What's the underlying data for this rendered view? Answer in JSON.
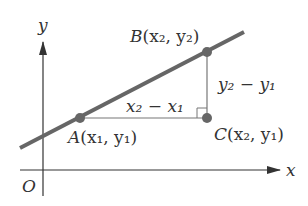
{
  "diagram": {
    "type": "coordinate-geometry",
    "colors": {
      "axis": "#333333",
      "line": "#666666",
      "point": "#666666",
      "guide": "#777777",
      "text": "#333333"
    },
    "axes": {
      "x_label": "x",
      "y_label": "y",
      "origin_label": "O"
    },
    "points": {
      "A": {
        "name": "A",
        "coords": "(x₁, y₁)"
      },
      "B": {
        "name": "B",
        "coords": "(x₂, y₂)"
      },
      "C": {
        "name": "C",
        "coords": "(x₂, y₁)"
      }
    },
    "segments": {
      "run_label": "x₂ − x₁",
      "rise_label": "y₂ − y₁"
    }
  }
}
